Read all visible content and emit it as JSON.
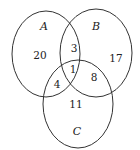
{
  "diagram": {
    "type": "venn",
    "sets": [
      {
        "name": "A",
        "cx": 46,
        "cy": 54,
        "rx": 34,
        "ry": 43
      },
      {
        "name": "B",
        "cx": 96,
        "cy": 53,
        "rx": 36,
        "ry": 44
      },
      {
        "name": "C",
        "cx": 78,
        "cy": 104,
        "rx": 35,
        "ry": 44
      }
    ],
    "regions": {
      "A_only": "20",
      "B_only": "17",
      "C_only": "11",
      "A_and_B_only": "3",
      "A_and_C_only": "4",
      "B_and_C_only": "8",
      "A_and_B_and_C": "1"
    },
    "stroke_color": "#333333"
  }
}
